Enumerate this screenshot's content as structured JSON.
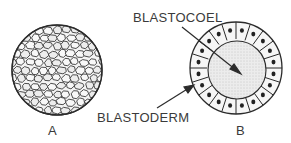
{
  "figure": {
    "panels": [
      {
        "id": "A",
        "label": "A",
        "description": "morula - solid ball of cells"
      },
      {
        "id": "B",
        "label": "B",
        "description": "blastula - hollow ball with cavity"
      }
    ],
    "annotations": {
      "blastocoel": "BLASTOCOEL",
      "blastoderm": "BLASTODERM"
    },
    "colors": {
      "ink": "#2b2b2b",
      "text": "#3a3a3a",
      "cell_fill": "#f2f2f2",
      "cavity_fill": "#e4e4e4",
      "nucleus": "#222222"
    }
  }
}
